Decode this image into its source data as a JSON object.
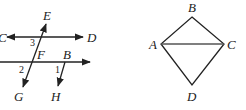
{
  "figure_left": {
    "description": "Two parallel lines cut by transversals",
    "points": {
      "C": "C",
      "D": "D",
      "E": "E",
      "F": "F",
      "B": "B",
      "G": "G",
      "H": "H"
    },
    "angles": {
      "a1": "1",
      "a2": "2",
      "a3": "3"
    }
  },
  "figure_right": {
    "description": "Quadrilateral ABCD with diagonal AC",
    "points": {
      "A": "A",
      "B": "B",
      "C": "C",
      "D": "D"
    }
  },
  "colors": {
    "stroke": "#222222",
    "background": "#ffffff"
  }
}
